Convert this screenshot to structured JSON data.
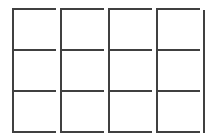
{
  "grid": {
    "rows": 3,
    "columns": 4,
    "line_color": "#404040",
    "background": "#ffffff",
    "column_lefts": [
      12,
      60,
      108,
      156
    ],
    "column_rights": [
      56,
      104,
      152,
      200
    ],
    "row_lines": [
      8,
      49,
      90,
      131
    ],
    "right_edge": 203,
    "cells": [
      [
        "",
        "",
        "",
        ""
      ],
      [
        "",
        "",
        "",
        ""
      ],
      [
        "",
        "",
        "",
        ""
      ]
    ]
  }
}
